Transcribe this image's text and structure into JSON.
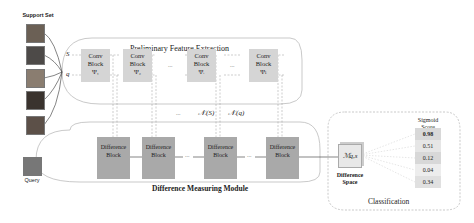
{
  "support_set": {
    "title": "Support Set",
    "images": [
      {
        "name": "support-image-1",
        "color": "#6b6055"
      },
      {
        "name": "support-image-2",
        "color": "#4d4a48"
      },
      {
        "name": "support-image-3",
        "color": "#8a7d70"
      },
      {
        "name": "support-image-4",
        "color": "#3a332e"
      },
      {
        "name": "support-image-5",
        "color": "#5c5048"
      }
    ]
  },
  "query": {
    "label": "Query",
    "color": "#777"
  },
  "feature_extraction": {
    "title": "Preliminary Feature Extraction",
    "row_labels": {
      "s": "S",
      "q": "q"
    },
    "blocks": [
      {
        "line1": "Conv",
        "line2": "Block",
        "sym": "Ψ₁"
      },
      {
        "line1": "Conv",
        "line2": "Block",
        "sym": "Ψ₂"
      },
      {
        "line1": "Conv",
        "line2": "Block",
        "sym": "Ψᵢ"
      },
      {
        "line1": "Conv",
        "line2": "Block",
        "sym": "Ψₗ"
      }
    ],
    "ellipsis": "..."
  },
  "intermediate_labels": {
    "ns": "𝒩ᵢ(S)",
    "nq": "𝒩ᵢ(q)",
    "ellipsis": "..."
  },
  "difference_module": {
    "title": "Difference Measuring Module",
    "blocks": [
      {
        "line1": "Difference",
        "line2": "Block"
      },
      {
        "line1": "Difference",
        "line2": "Block"
      },
      {
        "line1": "Difference",
        "line2": "Block"
      },
      {
        "line1": "Difference",
        "line2": "Block"
      }
    ],
    "ellipsis": "..."
  },
  "difference_space": {
    "symbol": "ℳq,s",
    "line1": "Difference",
    "line2": "Space"
  },
  "classification": {
    "title": "Classification",
    "score_header_1": "Sigmoid",
    "score_header_2": "Score",
    "scores": [
      "0.98",
      "0.51",
      "0.12",
      "0.04",
      "0.34"
    ]
  },
  "colors": {
    "conv_block": "#d5d5d5",
    "diff_block": "#a9a9a9",
    "outline": "#bbbbbb"
  }
}
